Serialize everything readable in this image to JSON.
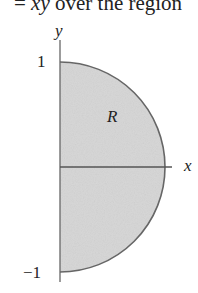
{
  "header": {
    "prefix": "= ",
    "expr": "xy",
    "suffix": " over the region"
  },
  "diagram": {
    "axis_x_label": "x",
    "axis_y_label": "y",
    "region_label": "R",
    "tick_top": "1",
    "tick_bottom": "−1",
    "shape": "right half-disk of radius 1 centered at origin",
    "fill_color": "#d9d9d9",
    "stroke_color": "#555555"
  }
}
